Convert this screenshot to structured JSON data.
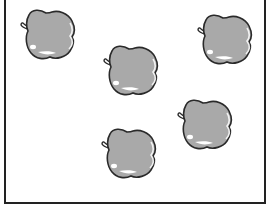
{
  "scene": {
    "description": "Five gray apples scattered in a bordered box",
    "count_label": "5",
    "apple_color": "#a9a9a9",
    "outline_color": "#2a2a2a",
    "highlight_color": "#ffffff",
    "apples": [
      {
        "id": "apple-1",
        "x": 18,
        "y": 7
      },
      {
        "id": "apple-2",
        "x": 101,
        "y": 43
      },
      {
        "id": "apple-3",
        "x": 195,
        "y": 12
      },
      {
        "id": "apple-4",
        "x": 175,
        "y": 97
      },
      {
        "id": "apple-5",
        "x": 99,
        "y": 126
      }
    ]
  }
}
